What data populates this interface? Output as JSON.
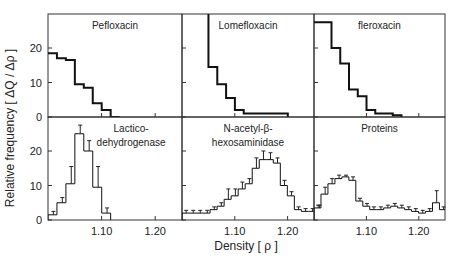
{
  "figure": {
    "ylabel": "Relative frequency [ ΔQ / Δρ ]",
    "xlabel": "Density [ ρ ]"
  },
  "chart_data": [
    {
      "type": "bar",
      "title": "Pefloxacin",
      "row": 0,
      "col": 0,
      "bold": true,
      "errors": false,
      "x_start": 1.0,
      "bin": 0.0167,
      "values": [
        18.5,
        17,
        16.5,
        9.5,
        8.5,
        4,
        2,
        0
      ],
      "ylim": [
        0,
        30
      ],
      "yticks": [
        0,
        10,
        20
      ],
      "xticks": [
        1.1,
        1.2
      ],
      "xlim": [
        1.0,
        1.25
      ]
    },
    {
      "type": "bar",
      "title": "Lomefloxacin",
      "row": 0,
      "col": 1,
      "bold": true,
      "errors": false,
      "x_start": 1.0,
      "bin": 0.0167,
      "values": [
        null,
        null,
        31,
        14.5,
        9.5,
        5.5,
        2,
        1,
        1,
        1,
        1,
        1
      ],
      "ylim": [
        0,
        30
      ],
      "yticks": [
        0,
        10,
        20
      ],
      "xticks": [
        1.1,
        1.2
      ],
      "xlim": [
        1.0,
        1.25
      ]
    },
    {
      "type": "bar",
      "title": "fleroxacin",
      "row": 0,
      "col": 2,
      "bold": true,
      "errors": false,
      "x_start": 1.0,
      "bin": 0.0167,
      "values": [
        27.5,
        27.5,
        20,
        15.5,
        8,
        6,
        2,
        1,
        1,
        0.5
      ],
      "ylim": [
        0,
        30
      ],
      "yticks": [
        0,
        10,
        20
      ],
      "xticks": [
        1.1,
        1.2
      ],
      "xlim": [
        1.0,
        1.25
      ]
    },
    {
      "type": "bar",
      "title": "Lactico-\ndehydrogenase",
      "row": 1,
      "col": 0,
      "bold": false,
      "errors": true,
      "x_start": 1.0,
      "bin": 0.0167,
      "values": [
        1.5,
        5,
        10.5,
        25,
        20,
        9.5,
        2
      ],
      "err": [
        1,
        1.5,
        5,
        2.5,
        3,
        6,
        1.5
      ],
      "ylim": [
        0,
        30
      ],
      "yticks": [
        0,
        10,
        20
      ],
      "xticks": [
        1.1,
        1.2
      ],
      "xlim": [
        1.0,
        1.25
      ]
    },
    {
      "type": "bar",
      "title": "N-acetyl-β-\nhexosaminidase",
      "row": 1,
      "col": 1,
      "bold": false,
      "errors": true,
      "x_start": 1.0,
      "bin": 0.0133,
      "values": [
        2,
        2,
        2,
        2,
        3,
        4,
        6,
        7,
        9,
        10.5,
        15,
        17.5,
        17.5,
        16.5,
        10,
        7,
        3,
        2.5,
        2.5,
        3.5
      ],
      "err": [
        0.8,
        0.8,
        0.8,
        0.8,
        0.8,
        1,
        3,
        2,
        2,
        1.5,
        3,
        2.5,
        2,
        1.5,
        1.5,
        1.2,
        0.8,
        0.8,
        0.8,
        0.8
      ],
      "ylim": [
        0,
        30
      ],
      "yticks": [
        0,
        10,
        20
      ],
      "xticks": [
        1.1,
        1.2
      ],
      "xlim": [
        1.0,
        1.25
      ]
    },
    {
      "type": "bar",
      "title": "Proteins",
      "row": 1,
      "col": 2,
      "bold": false,
      "errors": true,
      "x_start": 1.0,
      "bin": 0.0133,
      "values": [
        3.5,
        7.5,
        10.5,
        12,
        12.5,
        11.5,
        5.5,
        4,
        3,
        3,
        3.5,
        4,
        3.5,
        3,
        2.5,
        2,
        2.5,
        5,
        3
      ],
      "err": [
        0.8,
        2,
        1.5,
        1,
        0.5,
        1,
        0.8,
        0.8,
        0.8,
        0.8,
        0.8,
        0.8,
        0.8,
        0.8,
        0.8,
        0.8,
        0.8,
        3.5,
        0.8
      ],
      "ylim": [
        0,
        30
      ],
      "yticks": [
        0,
        10,
        20
      ],
      "xticks": [
        1.1,
        1.2
      ],
      "xlim": [
        1.0,
        1.25
      ]
    }
  ]
}
